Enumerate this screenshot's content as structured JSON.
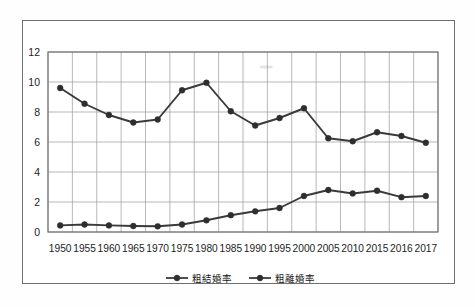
{
  "figure": {
    "frame_color": "#6e6e6e",
    "background": "#ffffff"
  },
  "chart_data": {
    "type": "line",
    "title": "",
    "subtitle": "",
    "xlabel": "",
    "ylabel": "",
    "categories": [
      "1950",
      "1955",
      "1960",
      "1965",
      "1970",
      "1975",
      "1980",
      "1985",
      "1990",
      "1995",
      "2000",
      "2005",
      "2010",
      "2015",
      "2016",
      "2017"
    ],
    "ylim": [
      0,
      12
    ],
    "yticks": [
      0,
      2,
      4,
      6,
      8,
      10,
      12
    ],
    "ytick_labels": [
      "0",
      "2",
      "4",
      "6",
      "8",
      "10",
      "12"
    ],
    "grid": true,
    "legend_position": "bottom-center",
    "line_color": "#3a3a3a",
    "marker_color": "#2e2e2e",
    "series": [
      {
        "name": "粗結婚率",
        "values": [
          9.6,
          8.55,
          7.8,
          7.3,
          7.5,
          9.45,
          9.95,
          8.05,
          7.1,
          7.6,
          8.25,
          6.25,
          6.05,
          6.65,
          6.4,
          5.95
        ]
      },
      {
        "name": "粗離婚率",
        "values": [
          0.44,
          0.5,
          0.44,
          0.4,
          0.38,
          0.5,
          0.78,
          1.12,
          1.38,
          1.6,
          2.4,
          2.8,
          2.57,
          2.75,
          2.32,
          2.4
        ]
      }
    ]
  },
  "legend": {
    "items": [
      {
        "label": "粗結婚率"
      },
      {
        "label": "粗離婚率"
      }
    ]
  }
}
